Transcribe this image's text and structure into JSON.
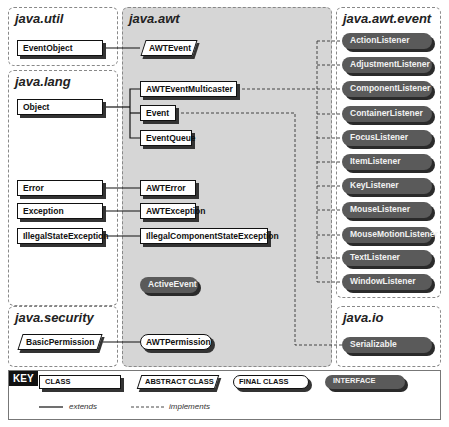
{
  "packages": {
    "util": "java.util",
    "lang": "java.lang",
    "awt": "java.awt",
    "event": "java.awt.event",
    "security": "java.security",
    "io": "java.io"
  },
  "classes": {
    "EventObject": "EventObject",
    "Object": "Object",
    "Error": "Error",
    "Exception": "Exception",
    "IllegalStateException": "IllegalStateException",
    "BasicPermission": "BasicPermission",
    "AWTEvent": "AWTEvent",
    "AWTEventMulticaster": "AWTEventMulticaster",
    "Event": "Event",
    "EventQueue": "EventQueue",
    "AWTError": "AWTError",
    "AWTException": "AWTException",
    "IllegalComponentStateException": "IllegalComponentStateException",
    "ActiveEvent": "ActiveEvent",
    "AWTPermission": "AWTPermission",
    "Serializable": "Serializable"
  },
  "listeners": [
    "ActionListener",
    "AdjustmentListener",
    "ComponentListener",
    "ContainerListener",
    "FocusListener",
    "ItemListener",
    "KeyListener",
    "MouseListener",
    "MouseMotionListener",
    "TextListener",
    "WindowListener"
  ],
  "key": {
    "title": "KEY",
    "class": "CLASS",
    "abstract": "ABSTRACT CLASS",
    "final": "FINAL CLASS",
    "interface": "INTERFACE",
    "extends": "extends",
    "implements": "implements"
  }
}
